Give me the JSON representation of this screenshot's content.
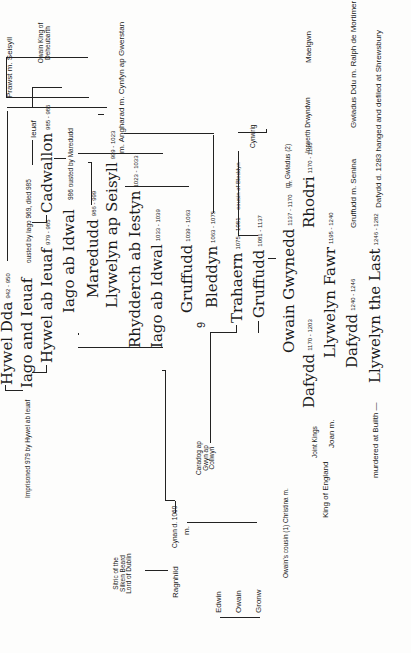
{
  "page_number": "9",
  "people": {
    "hywel_dda": {
      "name": "Hywel Dda",
      "dates": "942 - 950"
    },
    "iago_ieuaf": {
      "name": "Iago and Ieuaf",
      "note": "ousted by Iago 969, died 985"
    },
    "imprisoned_note": "Imprisoned 979 by Hywel ab Ieuaf",
    "ieuaf": "Ieuaf",
    "owain_deheubarth": "Owain King of Deheubarth",
    "hywel_ab_ieuaf": {
      "name": "Hywel ab Ieuaf",
      "dates": "979 - 985"
    },
    "cadwallon": {
      "name": "Cadwallon",
      "dates": "985 - 986"
    },
    "iago_ab_idwal_1": {
      "name": "Iago ab Idwal",
      "note": "986 ousted by Maredudd"
    },
    "maredudd": {
      "name": "Maredudd",
      "dates": "986 - 999"
    },
    "prawst_seisyll": {
      "left": "Prawst",
      "m": "m.",
      "right": "Seisyll"
    },
    "llywelyn_ap_seisyll": {
      "name": "Llywelyn ap Seisyll",
      "dates": "999 - 1023"
    },
    "angharad": {
      "m1": "m.",
      "name": "Angharad",
      "m2": "m.",
      "spouse": "Cynfyn ap Gwerstan"
    },
    "rhydderch": {
      "name": "Rhydderch ab Iestyn",
      "dates": "1023 - 1033"
    },
    "iago_ab_idwal_2": {
      "name": "Iago ab Idwal",
      "dates": "1033 - 1039"
    },
    "gruffudd_1": {
      "name": "Gruffudd",
      "dates": "1039 - 1063"
    },
    "bleddyn": {
      "name": "Bleddyn",
      "dates": "1063 - 1075"
    },
    "cynan": "Cynan d. 1060",
    "caradog": "Caradog ap Gwyn ap Collwyn",
    "trahaern": {
      "name": "Trahaern",
      "dates": "1075 - 1081",
      "note": "cousin of Bleddyn"
    },
    "gruffudd_2": {
      "name": "Gruffudd",
      "dates": "1081 - 1137"
    },
    "sitric": "Sitric of the Silken Beard Lord of Dublin",
    "ragnhild": {
      "name": "Ragnhild",
      "m": "m."
    },
    "sons": [
      "Edwin",
      "Owain",
      "Gronw"
    ],
    "owain_gwynedd": {
      "name": "Owain Gwynedd",
      "dates": "1137 - 1170",
      "m": "m."
    },
    "cynwrig": "Cynwrig",
    "gwladus2": {
      "m": "m.",
      "name": "Gwladus (2)"
    },
    "christina": {
      "text": "Owain's cousin (1) Christina",
      "m": "m."
    },
    "dafydd_1": {
      "name": "Dafydd",
      "dates": "1170 - 1203"
    },
    "rhodri": {
      "name": "Rhodri",
      "dates": "1170 - 1195"
    },
    "iorwerth": "Iorwerth Drwyndwn",
    "maelgwn": "Maelgwn",
    "joint_kings": "Joint Kings",
    "king_england": "King of England",
    "joan": {
      "name": "Joan",
      "m": "m."
    },
    "llywelyn_fawr": {
      "name": "Llywelyn Fawr",
      "dates": "1195 - 1240"
    },
    "dafydd_2": {
      "name": "Dafydd",
      "dates": "1240 - 1246"
    },
    "gruffudd_3": {
      "name": "Gruffudd",
      "m": "m.",
      "spouse": "Senina"
    },
    "gwladus_ddu": {
      "name": "Gwladus Ddu",
      "m": "m.",
      "spouse": "Ralph de Mortimer"
    },
    "llywelyn_last": {
      "name": "Llywelyn the Last",
      "dates": "1246 - 1282",
      "note": "murdered at Builth",
      "dash": "—"
    },
    "dafydd_3": {
      "name": "Dafydd",
      "note": "d. 1283 hanged and defiled at Shrewsbury"
    }
  }
}
